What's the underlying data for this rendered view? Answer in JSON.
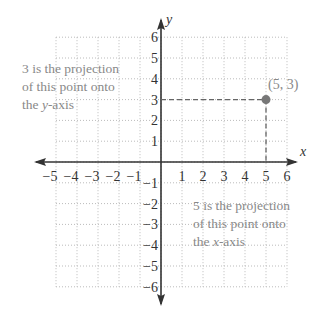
{
  "diagram": {
    "axes": {
      "x_label": "x",
      "y_label": "y",
      "x_range": [
        -5,
        6
      ],
      "y_range": [
        -6,
        6
      ]
    },
    "x_ticks": [
      "-5",
      "-4",
      "-3",
      "-2",
      "-1",
      "1",
      "2",
      "3",
      "4",
      "5",
      "6"
    ],
    "y_ticks": [
      "6",
      "5",
      "4",
      "3",
      "2",
      "1",
      "-1",
      "-2",
      "-3",
      "-4",
      "-5",
      "-6"
    ],
    "point": {
      "label": "(5, 3)",
      "x": 5,
      "y": 3,
      "color": "#777777"
    },
    "annotation_y": [
      "3 is the projection",
      "of this point onto",
      "the y-axis"
    ],
    "annotation_x": [
      "5 is the projection",
      "of this point onto",
      "the x-axis"
    ],
    "colors": {
      "grid": "#bbbbbb",
      "axis": "#333333",
      "dash": "#666666"
    }
  }
}
